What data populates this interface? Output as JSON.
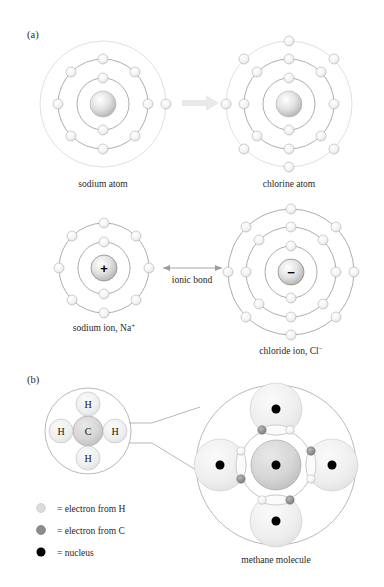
{
  "figure": {
    "panel_a_label": "(a)",
    "panel_b_label": "(b)"
  },
  "panel_a": {
    "sodium_atom": {
      "caption": "sodium atom",
      "nucleus_label": "",
      "shells": [
        2,
        8,
        1
      ],
      "cx": 103,
      "cy": 104,
      "shell_radii": [
        26,
        45,
        63
      ]
    },
    "chlorine_atom": {
      "caption": "chlorine atom",
      "nucleus_label": "",
      "shells": [
        2,
        8,
        7
      ],
      "cx": 289,
      "cy": 104,
      "shell_radii": [
        26,
        45,
        63
      ]
    },
    "transfer_arrow": {
      "name": "electron-transfer-arrow",
      "direction": "right",
      "color": "#e8e8e8"
    },
    "sodium_ion": {
      "caption": "sodium ion, Na",
      "caption_superscript": "+",
      "nucleus_label": "+",
      "shells": [
        2,
        8
      ],
      "cx": 104,
      "cy": 268,
      "shell_radii": [
        26,
        45
      ]
    },
    "chloride_ion": {
      "caption": "chloride ion, Cl",
      "caption_superscript": "−",
      "nucleus_label": "−",
      "shells": [
        2,
        8,
        8
      ],
      "cx": 291,
      "cy": 272,
      "shell_radii": [
        26,
        45,
        63
      ]
    },
    "ionic_bond": {
      "label": "ionic bond",
      "arrow": "double-headed"
    }
  },
  "panel_b": {
    "methane_formula": {
      "center_atom": "C",
      "outer_atoms": [
        "H",
        "H",
        "H",
        "H"
      ],
      "cx": 88,
      "cy": 431
    },
    "methane_molecule": {
      "caption": "methane molecule",
      "cx": 276,
      "cy": 465,
      "hydrogen_count": 4,
      "bond_electron_pairs": 4
    },
    "legend": [
      {
        "marker": "electron-from-h",
        "color": "#d8d8d8",
        "text": "= electron from H"
      },
      {
        "marker": "electron-from-c",
        "color": "#8c8c8c",
        "text": "= electron from C"
      },
      {
        "marker": "nucleus",
        "color": "#000000",
        "text": "= nucleus"
      }
    ]
  },
  "colors": {
    "electron_fill": "#f2f2f2",
    "electron_stroke": "#b4b4b4",
    "nucleus_light": "#ffffff",
    "nucleus_mid": "#c8c8c8",
    "shell_line": "#8a8a8a",
    "faint_line": "#d2d2d2",
    "hydrogen_cloud": "#efefef",
    "carbon_cloud": "#d4d4d4"
  }
}
